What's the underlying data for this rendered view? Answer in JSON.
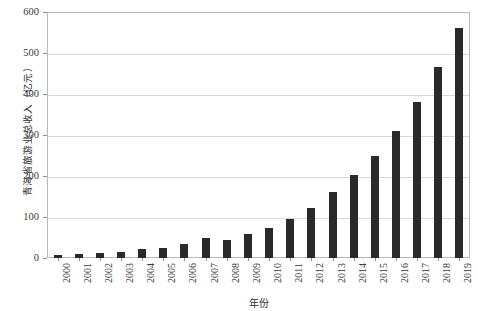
{
  "chart_data": {
    "type": "bar",
    "title": "",
    "xlabel": "年份",
    "ylabel": "青海省旅游业总收入（亿元）",
    "categories": [
      "2000",
      "2001",
      "2002",
      "2003",
      "2004",
      "2005",
      "2006",
      "2007",
      "2008",
      "2009",
      "2010",
      "2011",
      "2012",
      "2013",
      "2014",
      "2015",
      "2016",
      "2017",
      "2018",
      "2019"
    ],
    "values": [
      8,
      11,
      13,
      14,
      21,
      25,
      35,
      48,
      45,
      58,
      74,
      95,
      123,
      160,
      202,
      248,
      309,
      380,
      467,
      561
    ],
    "ylim": [
      0,
      600
    ],
    "yticks": [
      0,
      100,
      200,
      300,
      400,
      500,
      600
    ],
    "ytick_labels": [
      "0",
      "100",
      "200",
      "300",
      "400",
      "500",
      "600"
    ],
    "grid": true,
    "legend": "none",
    "bar_color": "#2a2a2a",
    "grid_color": "#d7d7d7",
    "frame_color": "#b9b9b9"
  }
}
